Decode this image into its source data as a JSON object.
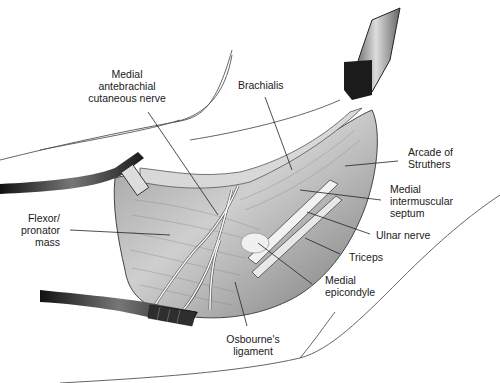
{
  "figure": {
    "labels": {
      "mabcn": [
        "Medial",
        "antebrachial",
        "cutaneous nerve"
      ],
      "brachialis": [
        "Brachialis"
      ],
      "arcade": [
        "Arcade of",
        "Struthers"
      ],
      "septum": [
        "Medial",
        "intermuscular",
        "septum"
      ],
      "ulnar": [
        "Ulnar nerve"
      ],
      "triceps": [
        "Triceps"
      ],
      "epicondyle": [
        "Medial",
        "epicondyle"
      ],
      "osbourne": [
        "Osbourne's",
        "ligament"
      ],
      "flexor": [
        "Flexor/",
        "pronator",
        "mass"
      ]
    },
    "colors": {
      "outline": "#3a3a3a",
      "tissue_light": "#e6e6e6",
      "tissue_mid": "#bdbdbd",
      "tissue_dark": "#6e6e6e",
      "retractor": "#2a2a2a",
      "nerve": "#f4f4f4",
      "leader": "#222222"
    }
  }
}
